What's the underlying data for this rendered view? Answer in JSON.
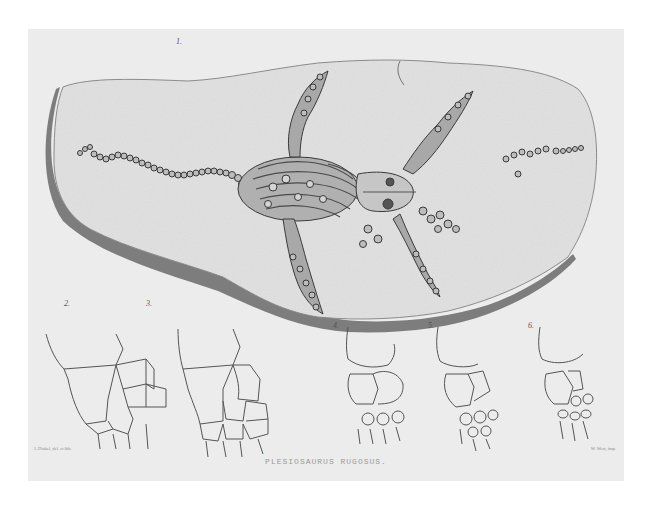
{
  "plate": {
    "title": "PLESIOSAURUS RUGOSUS.",
    "credit_left": "J. Dinkel, del. et lith.",
    "credit_right": "W. West, imp.",
    "colors": {
      "paper": "#ececec",
      "slab": "#e2e2e2",
      "shadow": "#555555",
      "ink": "#3a3a3a"
    }
  },
  "figures": [
    {
      "number": "1.",
      "subject": "fossil slab with skeleton"
    },
    {
      "number": "2.",
      "subject": "limb bones",
      "labels": [
        "33.",
        "32.",
        "34.",
        "35.",
        "p",
        "i",
        "c",
        "u",
        "II",
        "I.",
        "II.",
        "III.",
        "IV."
      ]
    },
    {
      "number": "3.",
      "subject": "limb bones",
      "labels": [
        "63",
        "63'",
        "64",
        "65",
        "d",
        "d'",
        "dd",
        "cm",
        "I",
        "II",
        "III",
        "IV"
      ]
    },
    {
      "number": "4.",
      "subject": "limb bones",
      "labels": [
        "33",
        "34",
        "35",
        "p",
        "i",
        "c",
        "Cm"
      ]
    },
    {
      "number": "5.",
      "subject": "limb bones",
      "labels": [
        "33",
        "34",
        "35",
        "p",
        "i",
        "c"
      ]
    },
    {
      "number": "6.",
      "subject": "limb bones",
      "labels": [
        "33",
        "34",
        "35",
        "i",
        "c"
      ]
    }
  ]
}
